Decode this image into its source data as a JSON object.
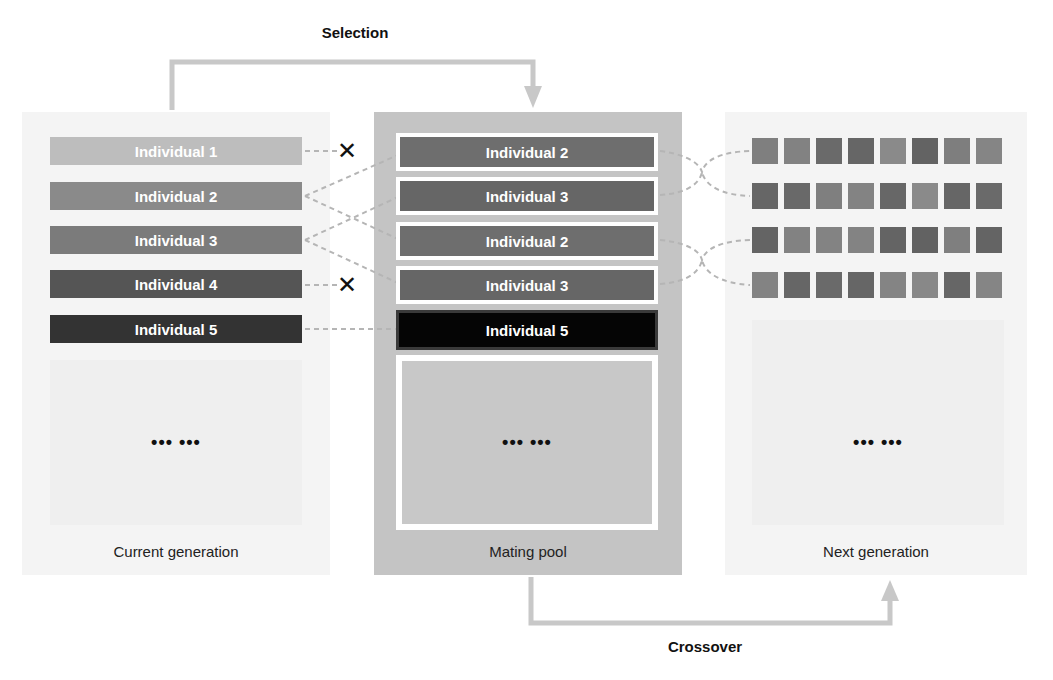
{
  "steps": {
    "selection_label": "Selection",
    "crossover_label": "Crossover"
  },
  "panels": {
    "current": {
      "label": "Current generation",
      "individuals": [
        {
          "label": "Individual 1",
          "color": "#bdbdbd",
          "selected": false
        },
        {
          "label": "Individual 2",
          "color": "#8a8a8a",
          "selected": true
        },
        {
          "label": "Individual 3",
          "color": "#7b7b7b",
          "selected": true
        },
        {
          "label": "Individual 4",
          "color": "#555555",
          "selected": false
        },
        {
          "label": "Individual 5",
          "color": "#333333",
          "selected": true
        }
      ],
      "ellipsis": "••• •••"
    },
    "mating": {
      "label": "Mating pool",
      "individuals": [
        {
          "label": "Individual 2",
          "color": "#6e6e6e"
        },
        {
          "label": "Individual 3",
          "color": "#666666"
        },
        {
          "label": "Individual 2",
          "color": "#6e6e6e"
        },
        {
          "label": "Individual 3",
          "color": "#666666"
        },
        {
          "label": "Individual 5",
          "color": "#050505"
        }
      ],
      "ellipsis": "••• •••"
    },
    "next": {
      "label": "Next generation",
      "offspring": [
        {
          "genes": [
            "#7f7f7f",
            "#828282",
            "#6a6a6a",
            "#666666",
            "#8a8a8a",
            "#636363",
            "#7e7e7e",
            "#858585"
          ]
        },
        {
          "genes": [
            "#666666",
            "#696969",
            "#7f7f7f",
            "#838383",
            "#676767",
            "#8a8a8a",
            "#666666",
            "#6a6a6a"
          ]
        },
        {
          "genes": [
            "#646464",
            "#828282",
            "#838383",
            "#838383",
            "#646464",
            "#626262",
            "#7f7f7f",
            "#646464"
          ]
        },
        {
          "genes": [
            "#838383",
            "#666666",
            "#6a6a6a",
            "#666666",
            "#848484",
            "#888888",
            "#666666",
            "#858585"
          ]
        }
      ],
      "ellipsis": "••• •••"
    }
  },
  "symbols": {
    "rejected_icon": "✕"
  },
  "colors": {
    "arrow": "#c8c8c8",
    "dashed_link": "#b5b5b5",
    "current_panel_bg": "#f4f4f4",
    "mating_panel_bg": "#c4c4c4"
  }
}
